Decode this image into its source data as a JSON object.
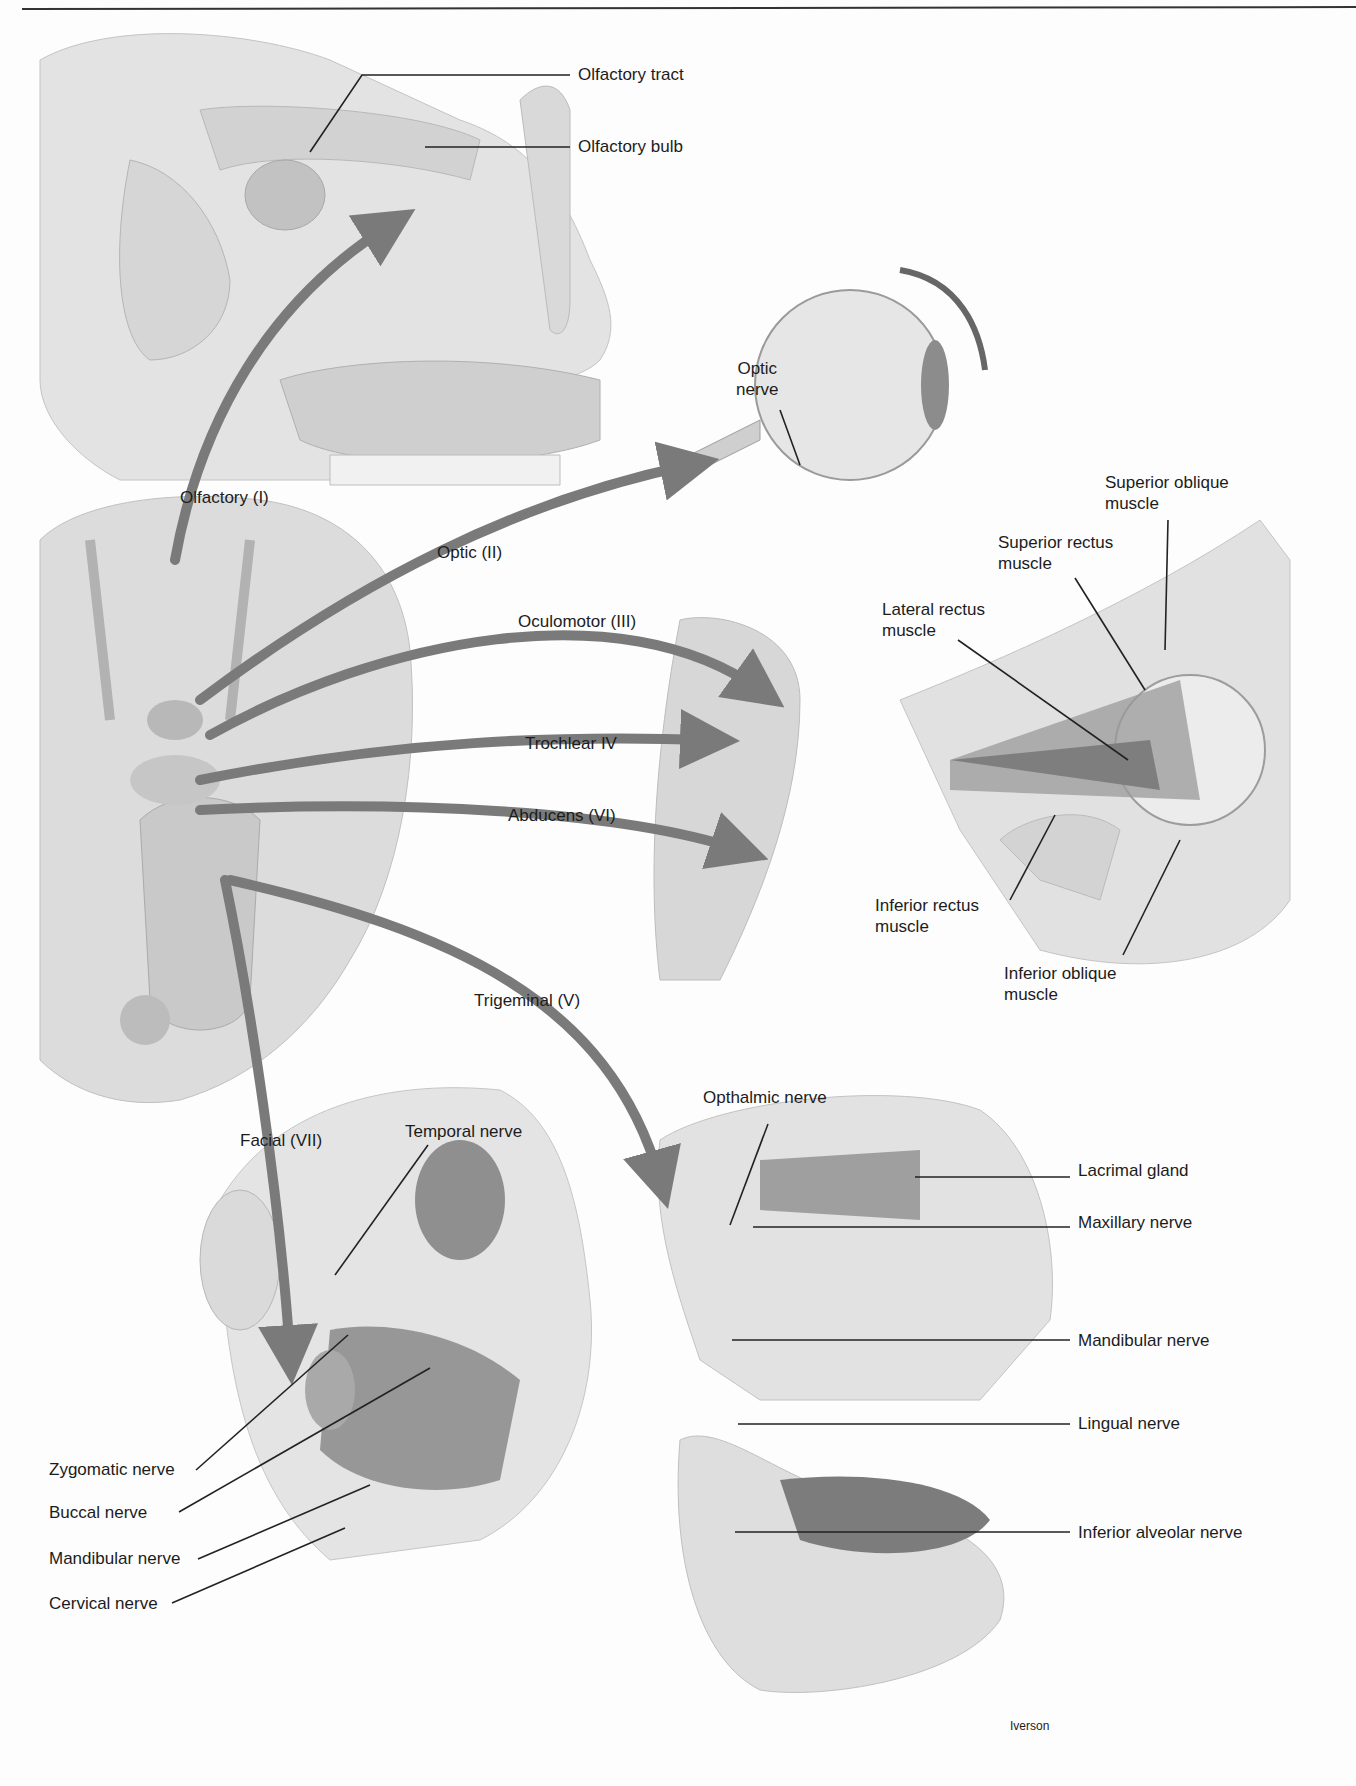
{
  "diagram": {
    "palette": {
      "arrow": "#7a7a7a",
      "tissue": "#cfcfcf",
      "muscle": "#8e8e8e",
      "bone": "#d9d9d9",
      "line": "#222222"
    },
    "nerve_labels": {
      "olfactory": "Olfactory (I)",
      "optic": "Optic (II)",
      "oculomotor": "Oculomotor (III)",
      "trochlear": "Trochlear IV",
      "abducens": "Abducens (VI)",
      "trigeminal": "Trigeminal (V)",
      "facial": "Facial (VII)"
    },
    "nose_panel": {
      "olfactory_tract": "Olfactory tract",
      "olfactory_bulb": "Olfactory bulb"
    },
    "eye_panel": {
      "optic_nerve": "Optic\nnerve"
    },
    "orbit_panel": {
      "superior_oblique": "Superior oblique\nmuscle",
      "superior_rectus": "Superior rectus\nmuscle",
      "lateral_rectus": "Lateral rectus\nmuscle",
      "inferior_rectus": "Inferior rectus\nmuscle",
      "inferior_oblique": "Inferior oblique\nmuscle"
    },
    "face_panel": {
      "temporal_nerve": "Temporal nerve",
      "zygomatic_nerve": "Zygomatic nerve",
      "buccal_nerve": "Buccal nerve",
      "mandibular_nerve": "Mandibular nerve",
      "cervical_nerve": "Cervical nerve"
    },
    "skull_panel": {
      "opthalmic_nerve": "Opthalmic nerve",
      "lacrimal_gland": "Lacrimal gland",
      "maxillary_nerve": "Maxillary nerve",
      "mandibular_nerve": "Mandibular nerve",
      "lingual_nerve": "Lingual nerve",
      "inferior_alveolar_nerve": "Inferior alveolar nerve"
    },
    "signature": "Iverson"
  }
}
